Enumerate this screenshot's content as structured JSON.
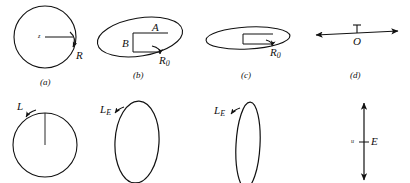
{
  "figure": {
    "background_color": "#ffffff",
    "stroke_color": "#111111",
    "panels": [
      {
        "id": "a",
        "caption": "(a)",
        "shape": "circle",
        "labels": {
          "center": "z",
          "radius": "R"
        }
      },
      {
        "id": "b",
        "caption": "(b)",
        "shape": "ellipse-tilted-with-notch",
        "labels": {
          "upper": "A",
          "left": "B",
          "radius": "R",
          "radius_sub": "0"
        }
      },
      {
        "id": "c",
        "caption": "(c)",
        "shape": "ellipse-flat-with-notch",
        "labels": {
          "radius": "R",
          "radius_sub": "0"
        }
      },
      {
        "id": "d",
        "caption": "(d)",
        "shape": "horizontal-double-arrow",
        "labels": {
          "origin": "O"
        }
      },
      {
        "id": "e",
        "caption": "",
        "shape": "circle-with-radius-line",
        "labels": {
          "angular_momentum": "L"
        }
      },
      {
        "id": "f",
        "caption": "",
        "shape": "vertical-ellipse",
        "labels": {
          "angular_momentum": "L",
          "angular_momentum_sub": "E"
        }
      },
      {
        "id": "g",
        "caption": "",
        "shape": "vertical-ellipse-narrow",
        "labels": {
          "angular_momentum": "L",
          "angular_momentum_sub": "E"
        }
      },
      {
        "id": "h",
        "caption": "",
        "shape": "vertical-double-arrow",
        "labels": {
          "energy": "E",
          "tick": "u"
        }
      }
    ]
  }
}
